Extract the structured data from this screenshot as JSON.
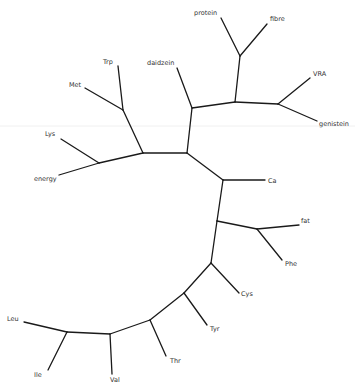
{
  "diagram": {
    "type": "unrooted-phylogenetic-tree",
    "leaves": [
      {
        "id": "protein",
        "label": "protein"
      },
      {
        "id": "fibre",
        "label": "fibre"
      },
      {
        "id": "VRA",
        "label": "VRA"
      },
      {
        "id": "genistein",
        "label": "genistein"
      },
      {
        "id": "daidzein",
        "label": "daidzein"
      },
      {
        "id": "Trp",
        "label": "Trp"
      },
      {
        "id": "Met",
        "label": "Met"
      },
      {
        "id": "Lys",
        "label": "Lys"
      },
      {
        "id": "energy",
        "label": "energy"
      },
      {
        "id": "Ca",
        "label": "Ca"
      },
      {
        "id": "fat",
        "label": "fat"
      },
      {
        "id": "Phe",
        "label": "Phe"
      },
      {
        "id": "Cys",
        "label": "Cys"
      },
      {
        "id": "Tyr",
        "label": "Tyr"
      },
      {
        "id": "Thr",
        "label": "Thr"
      },
      {
        "id": "Leu",
        "label": "Leu"
      },
      {
        "id": "Ile",
        "label": "Ile"
      },
      {
        "id": "Val",
        "label": "Val"
      }
    ],
    "labels": {
      "protein": "protein",
      "fibre": "fibre",
      "VRA": "VRA",
      "genistein": "genistein",
      "daidzein": "daidzein",
      "Trp": "Trp",
      "Met": "Met",
      "Lys": "Lys",
      "energy": "energy",
      "Ca": "Ca",
      "fat": "fat",
      "Phe": "Phe",
      "Cys": "Cys",
      "Tyr": "Tyr",
      "Thr": "Thr",
      "Leu": "Leu",
      "Ile": "Ile",
      "Val": "Val"
    },
    "line_color": "#1a1a1a",
    "label_color": "#333333"
  }
}
